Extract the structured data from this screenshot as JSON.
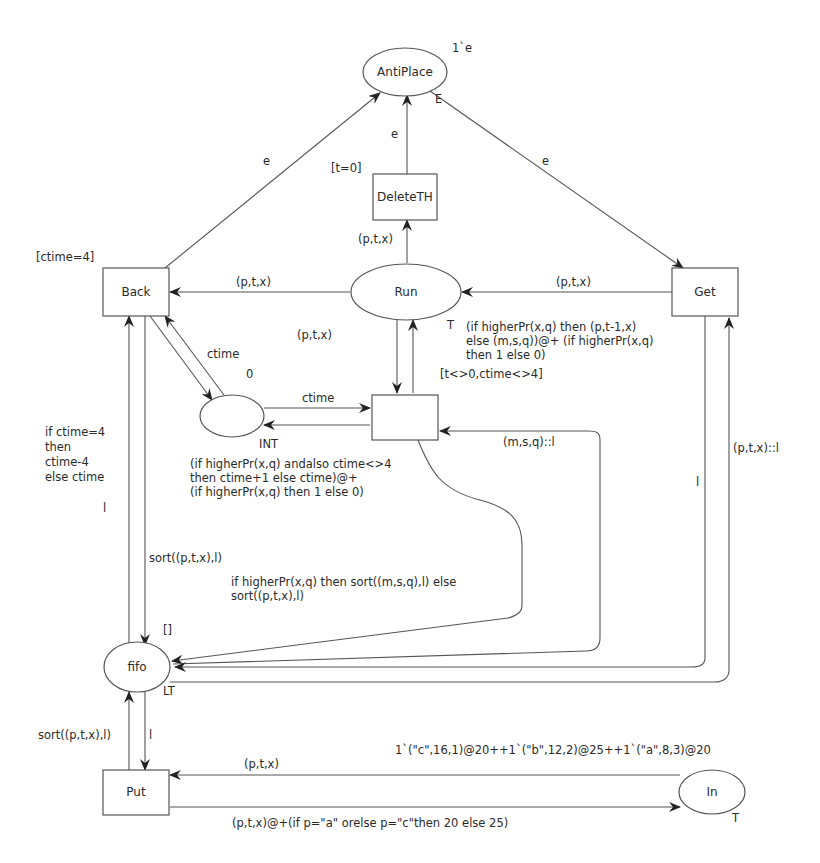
{
  "diagram": {
    "type": "colored-petri-net",
    "places": {
      "antiplace": {
        "label": "AntiPlace",
        "marking": "1`e",
        "colorset": "E"
      },
      "run": {
        "label": "Run",
        "colorset": "T"
      },
      "counter": {
        "label": "",
        "marking": "0",
        "colorset": "INT"
      },
      "fifo": {
        "label": "fifo",
        "marking": "[]",
        "colorset": "LT"
      },
      "in": {
        "label": "In",
        "marking": "1`(\"c\",16,1)@20++1`(\"b\",12,2)@25++1`(\"a\",8,3)@20",
        "colorset": "T"
      }
    },
    "transitions": {
      "deleteth": {
        "label": "DeleteTH",
        "guard": "[t=0]"
      },
      "back": {
        "label": "Back",
        "guard": "[ctime=4]"
      },
      "get": {
        "label": "Get"
      },
      "process": {
        "label": "",
        "guard": "[t<>0,ctime<>4]"
      },
      "put": {
        "label": "Put"
      }
    },
    "arcs": {
      "back_to_antiplace": "e",
      "deleteth_to_antiplace": "e",
      "antiplace_to_get": "e",
      "run_to_deleteth": "(p,t,x)",
      "run_to_back": "(p,t,x)",
      "get_to_run": "(p,t,x)",
      "run_to_process": "(p,t,x)",
      "process_to_run": [
        "(if higherPr(x,q) then (p,t-1,x)",
        "else (m,s,q))@+ (if higherPr(x,q)",
        "then 1 else 0)"
      ],
      "back_counter": "ctime",
      "counter_to_process": "ctime",
      "process_to_counter": [
        "(if higherPr(x,q) andalso ctime<>4",
        "then ctime+1 else ctime)@+",
        "(if higherPr(x,q) then 1 else 0)"
      ],
      "counter_to_back": [
        "if ctime=4",
        "then",
        "ctime-4",
        "else ctime"
      ],
      "fifo_to_back": "l",
      "back_to_fifo": "sort((p,t,x),l)",
      "process_to_fifo": [
        "if higherPr(x,q) then sort((m,s,q),l) else",
        "sort((p,t,x),l)"
      ],
      "fifo_to_process": "(m,s,q)::l",
      "get_to_fifo": "l",
      "fifo_to_get": "(p,t,x)::l",
      "put_to_fifo": "sort((p,t,x),l)",
      "fifo_to_put": "l",
      "in_to_put": "(p,t,x)",
      "put_to_in": "(p,t,x)@+(if p=\"a\" orelse p=\"c\"then 20 else 25)"
    }
  }
}
